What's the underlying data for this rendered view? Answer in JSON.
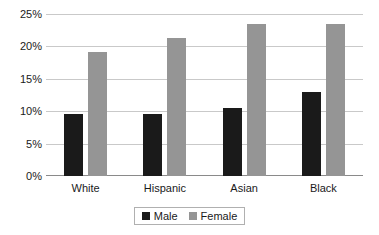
{
  "chart_data": {
    "type": "bar",
    "title": "",
    "subtitle": "",
    "xlabel": "",
    "ylabel": "",
    "categories": [
      "White",
      "Hispanic",
      "Asian",
      "Black"
    ],
    "series": [
      {
        "name": "Male",
        "color": "#1a1a1a",
        "values": [
          9.5,
          9.6,
          10.5,
          13.0
        ]
      },
      {
        "name": "Female",
        "color": "#959595",
        "values": [
          19.2,
          21.3,
          23.4,
          23.5
        ]
      }
    ],
    "ylim": [
      0,
      25
    ],
    "ytick_step": 5,
    "ytick_labels": [
      "0%",
      "5%",
      "10%",
      "15%",
      "20%",
      "25%"
    ],
    "ytick_values": [
      0,
      5,
      10,
      15,
      20,
      25
    ],
    "grid": true,
    "grid_axis": "y",
    "legend_position": "bottom-center",
    "value_format": "percent",
    "annotations": []
  },
  "legend": {
    "entries": [
      {
        "label": "Male"
      },
      {
        "label": "Female"
      }
    ]
  }
}
